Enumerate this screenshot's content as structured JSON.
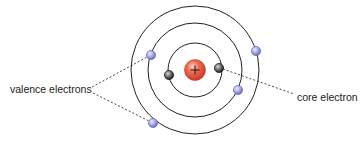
{
  "diagram": {
    "type": "bohr-atom-model",
    "labels": {
      "valence": "valence electrons",
      "core": "core electron"
    },
    "nucleus": {
      "symbol": "+",
      "cx": 195,
      "cy": 70,
      "r": 10,
      "color": "#e0533a"
    },
    "shells": [
      {
        "name": "inner-shell",
        "r": 27
      },
      {
        "name": "middle-shell",
        "r": 47
      },
      {
        "name": "outer-shell",
        "r": 64
      }
    ],
    "electrons": [
      {
        "type": "core",
        "cx": 169,
        "cy": 75,
        "color": "#555555"
      },
      {
        "type": "core",
        "cx": 219,
        "cy": 68,
        "color": "#555555"
      },
      {
        "type": "valence",
        "cx": 151,
        "cy": 55,
        "color": "#9a9ee0"
      },
      {
        "type": "valence",
        "cx": 238,
        "cy": 90,
        "color": "#9a9ee0"
      },
      {
        "type": "valence",
        "cx": 256,
        "cy": 51,
        "color": "#9a9ee0"
      },
      {
        "type": "valence",
        "cx": 153,
        "cy": 123,
        "color": "#9a9ee0"
      }
    ],
    "colors": {
      "shell_stroke": "#222222",
      "leader_line": "#333333",
      "background": "#ffffff"
    }
  }
}
